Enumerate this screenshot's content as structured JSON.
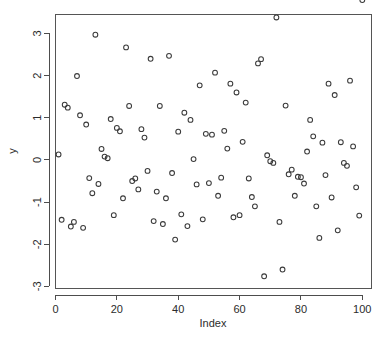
{
  "chart_data": {
    "type": "scatter",
    "title": "",
    "xlabel": "Index",
    "ylabel": "y",
    "xlim": [
      0,
      103
    ],
    "ylim": [
      -3.05,
      3.45
    ],
    "grid": false,
    "legend": null,
    "point_symbol": "open-circle",
    "point_color": "#3a3a3a",
    "xticks": [
      0,
      20,
      40,
      60,
      80,
      100
    ],
    "xtick_labels": [
      "0",
      "20",
      "40",
      "60",
      "80",
      "100"
    ],
    "yticks": [
      -3,
      -2,
      -1,
      0,
      1,
      2,
      3
    ],
    "ytick_labels": [
      "-3",
      "-2",
      "-1",
      "0",
      "1",
      "2",
      "3"
    ],
    "n_points": 100,
    "x": [
      1,
      2,
      3,
      4,
      5,
      6,
      7,
      8,
      9,
      10,
      11,
      12,
      13,
      14,
      15,
      16,
      17,
      18,
      19,
      20,
      21,
      22,
      23,
      24,
      25,
      26,
      27,
      28,
      29,
      30,
      31,
      32,
      33,
      34,
      35,
      36,
      37,
      38,
      39,
      40,
      41,
      42,
      43,
      44,
      45,
      46,
      47,
      48,
      49,
      50,
      51,
      52,
      53,
      54,
      55,
      56,
      57,
      58,
      59,
      60,
      61,
      62,
      63,
      64,
      65,
      66,
      67,
      68,
      69,
      70,
      71,
      72,
      73,
      74,
      75,
      76,
      77,
      78,
      79,
      80,
      81,
      82,
      83,
      84,
      85,
      86,
      87,
      88,
      89,
      90,
      91,
      92,
      93,
      94,
      95,
      96,
      97,
      98,
      99,
      100
    ],
    "y": [
      0.13,
      -1.42,
      1.31,
      1.24,
      -1.58,
      -1.47,
      1.99,
      1.06,
      -1.61,
      0.84,
      -0.43,
      -0.79,
      2.97,
      -0.57,
      0.26,
      0.08,
      0.04,
      0.97,
      -1.31,
      0.76,
      0.68,
      -0.91,
      2.67,
      1.28,
      -0.5,
      -0.44,
      -0.7,
      0.73,
      0.53,
      -0.26,
      2.4,
      -1.45,
      -0.75,
      1.28,
      -1.52,
      -0.91,
      2.47,
      -0.31,
      -1.89,
      0.67,
      -1.29,
      1.12,
      -1.57,
      0.95,
      0.02,
      -0.58,
      1.77,
      -1.41,
      0.62,
      -0.55,
      0.6,
      2.07,
      -0.85,
      -0.42,
      0.69,
      0.27,
      1.81,
      -1.36,
      1.6,
      -1.31,
      0.43,
      1.36,
      -0.44,
      -0.88,
      -1.1,
      2.29,
      2.39,
      -2.76,
      0.11,
      -0.03,
      -0.07,
      3.38,
      -1.47,
      -2.6,
      1.29,
      -0.34,
      -0.23,
      -0.85,
      -0.4,
      -0.41,
      -0.56,
      0.2,
      0.95,
      0.56,
      -1.1,
      -1.85,
      0.41,
      -0.36,
      1.81,
      -0.89,
      1.54,
      -1.67,
      0.42,
      -0.07,
      -0.14,
      1.88,
      0.32,
      -0.65,
      -1.32
    ]
  }
}
